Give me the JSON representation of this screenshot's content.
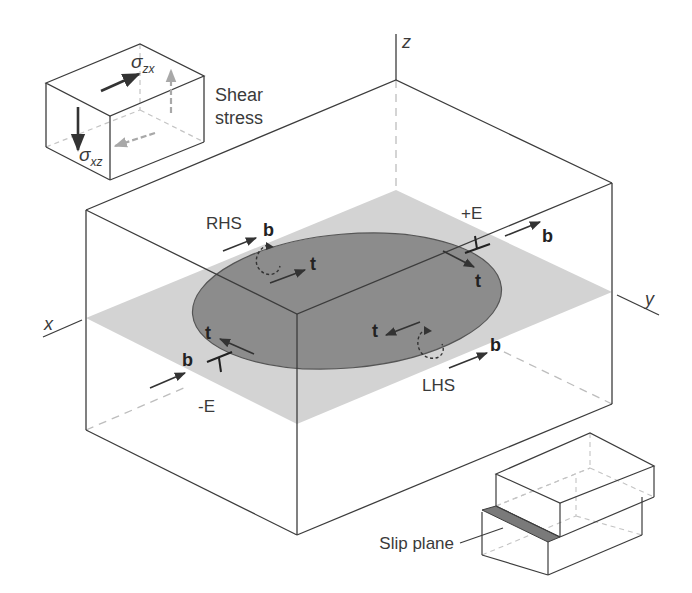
{
  "diagram": {
    "colors": {
      "line": "#3c3c3c",
      "hidden_line": "#bdbdbd",
      "slip_plane_fill": "#d3d3d3",
      "loop_fill": "#8c8c8c",
      "loop_stroke": "#555555",
      "arrow": "#333333",
      "arrow_gray": "#a8a8a8",
      "strip_fill": "#7a7a7a"
    },
    "axes": {
      "x_label": "x",
      "y_label": "y",
      "z_label": "z"
    },
    "stress_inset": {
      "label_line1": "Shear",
      "label_line2": "stress",
      "sigma_zx": {
        "symbol": "σ",
        "subscript": "zx"
      },
      "sigma_xz": {
        "symbol": "σ",
        "subscript": "xz"
      }
    },
    "loop_labels": {
      "rhs": "RHS",
      "lhs": "LHS",
      "plus_e": "+E",
      "minus_e": "-E",
      "burgers": "b",
      "tangent": "t"
    },
    "slip_inset": {
      "label": "Slip plane"
    }
  }
}
